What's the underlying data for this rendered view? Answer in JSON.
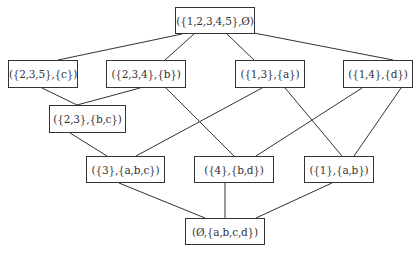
{
  "diagram": {
    "type": "hasse-diagram",
    "edge_color": "#333333",
    "nodes": [
      {
        "id": "n0",
        "label": "({1,2,3,4,5},Ø)",
        "x": 175,
        "y": 7,
        "w": 80,
        "h": 27
      },
      {
        "id": "n1",
        "label": "({2,3,5},{c})",
        "x": 8,
        "y": 60,
        "w": 70,
        "h": 28
      },
      {
        "id": "n2",
        "label": "({2,3,4},{b})",
        "x": 106,
        "y": 60,
        "w": 80,
        "h": 28
      },
      {
        "id": "n3",
        "label": "({1,3},{a})",
        "x": 235,
        "y": 60,
        "w": 70,
        "h": 28
      },
      {
        "id": "n4",
        "label": "({1,4},{d})",
        "x": 343,
        "y": 60,
        "w": 70,
        "h": 28
      },
      {
        "id": "n5",
        "label": "({2,3},{b,c})",
        "x": 49,
        "y": 105,
        "w": 77,
        "h": 28
      },
      {
        "id": "n6",
        "label": "({3},{a,b,c})",
        "x": 86,
        "y": 156,
        "w": 79,
        "h": 27
      },
      {
        "id": "n7",
        "label": "({4},{b,d})",
        "x": 194,
        "y": 156,
        "w": 80,
        "h": 27
      },
      {
        "id": "n8",
        "label": "({1},{a,b})",
        "x": 304,
        "y": 156,
        "w": 70,
        "h": 27
      },
      {
        "id": "n9",
        "label": "(Ø,{a,b,c,d})",
        "x": 185,
        "y": 218,
        "w": 80,
        "h": 27
      }
    ],
    "edges": [
      {
        "from": "n0",
        "to": "n1",
        "x1": 182,
        "y1": 34,
        "x2": 58,
        "y2": 60
      },
      {
        "from": "n0",
        "to": "n2",
        "x1": 194,
        "y1": 34,
        "x2": 165,
        "y2": 60
      },
      {
        "from": "n0",
        "to": "n3",
        "x1": 227,
        "y1": 34,
        "x2": 254,
        "y2": 60
      },
      {
        "from": "n0",
        "to": "n4",
        "x1": 254,
        "y1": 33,
        "x2": 393,
        "y2": 60
      },
      {
        "from": "n1",
        "to": "n5",
        "x1": 42,
        "y1": 88,
        "x2": 77,
        "y2": 105
      },
      {
        "from": "n2",
        "to": "n5",
        "x1": 140,
        "y1": 88,
        "x2": 77,
        "y2": 105
      },
      {
        "from": "n2",
        "to": "n7",
        "x1": 166,
        "y1": 88,
        "x2": 234,
        "y2": 156
      },
      {
        "from": "n3",
        "to": "n6",
        "x1": 262,
        "y1": 88,
        "x2": 136,
        "y2": 156
      },
      {
        "from": "n3",
        "to": "n8",
        "x1": 285,
        "y1": 88,
        "x2": 342,
        "y2": 156
      },
      {
        "from": "n4",
        "to": "n7",
        "x1": 362,
        "y1": 88,
        "x2": 256,
        "y2": 156
      },
      {
        "from": "n4",
        "to": "n8",
        "x1": 401,
        "y1": 88,
        "x2": 354,
        "y2": 156
      },
      {
        "from": "n5",
        "to": "n6",
        "x1": 70,
        "y1": 133,
        "x2": 107,
        "y2": 156
      },
      {
        "from": "n6",
        "to": "n9",
        "x1": 119,
        "y1": 183,
        "x2": 205,
        "y2": 218
      },
      {
        "from": "n7",
        "to": "n9",
        "x1": 225,
        "y1": 183,
        "x2": 225,
        "y2": 218
      },
      {
        "from": "n8",
        "to": "n9",
        "x1": 332,
        "y1": 183,
        "x2": 256,
        "y2": 218
      }
    ]
  }
}
